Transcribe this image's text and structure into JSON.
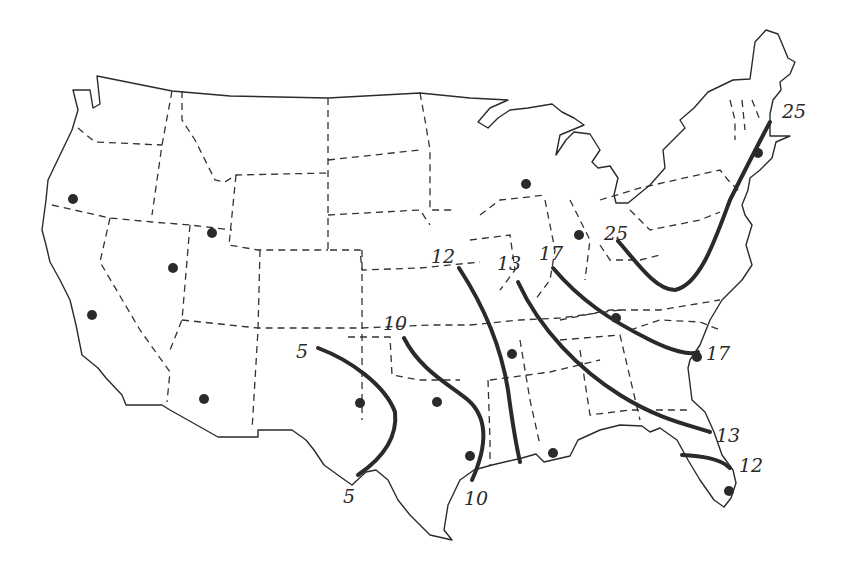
{
  "map": {
    "title": "",
    "region": "Contiguous United States",
    "style": "hand-drawn outline with dashed state borders",
    "colors": {
      "background": "#ffffff",
      "ink": "#2a2a2a"
    },
    "isolines": [
      {
        "id": "iso-5",
        "value": "5",
        "labels": [
          {
            "text": "5",
            "x": 296,
            "y": 358
          },
          {
            "text": "5",
            "x": 343,
            "y": 503
          }
        ]
      },
      {
        "id": "iso-10",
        "value": "10",
        "labels": [
          {
            "text": "10",
            "x": 383,
            "y": 330
          },
          {
            "text": "10",
            "x": 464,
            "y": 505
          }
        ]
      },
      {
        "id": "iso-12",
        "value": "12",
        "labels": [
          {
            "text": "12",
            "x": 431,
            "y": 263
          },
          {
            "text": "12",
            "x": 739,
            "y": 472
          }
        ]
      },
      {
        "id": "iso-13",
        "value": "13",
        "labels": [
          {
            "text": "13",
            "x": 497,
            "y": 270
          },
          {
            "text": "13",
            "x": 716,
            "y": 442
          }
        ]
      },
      {
        "id": "iso-17",
        "value": "17",
        "labels": [
          {
            "text": "17",
            "x": 539,
            "y": 260
          },
          {
            "text": "17",
            "x": 706,
            "y": 360
          }
        ]
      },
      {
        "id": "iso-25",
        "value": "25",
        "labels": [
          {
            "text": "25",
            "x": 604,
            "y": 240
          },
          {
            "text": "25",
            "x": 782,
            "y": 118
          }
        ]
      }
    ],
    "sites": [
      {
        "x": 73,
        "y": 199
      },
      {
        "x": 212,
        "y": 233
      },
      {
        "x": 173,
        "y": 268
      },
      {
        "x": 92,
        "y": 315
      },
      {
        "x": 204,
        "y": 399
      },
      {
        "x": 360,
        "y": 403
      },
      {
        "x": 437,
        "y": 402
      },
      {
        "x": 470,
        "y": 456
      },
      {
        "x": 512,
        "y": 354
      },
      {
        "x": 553,
        "y": 453
      },
      {
        "x": 526,
        "y": 184
      },
      {
        "x": 579,
        "y": 235
      },
      {
        "x": 616,
        "y": 318
      },
      {
        "x": 697,
        "y": 357
      },
      {
        "x": 729,
        "y": 491
      },
      {
        "x": 758,
        "y": 153
      }
    ]
  }
}
